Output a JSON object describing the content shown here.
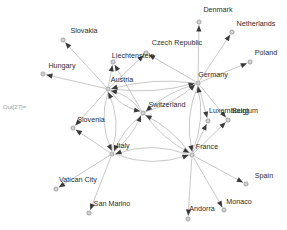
{
  "notebook": {
    "out_label": "Out[27]="
  },
  "graph": {
    "type": "directed-network",
    "title": "",
    "node_style": {
      "fill": "#d4d4d4",
      "stroke": "#8a8a8a",
      "radius": 2.1
    },
    "edge_style": {
      "stroke": "#9a9a9a",
      "width": 0.55,
      "arrow_fill": "#3a3a3a"
    },
    "nodes": [
      {
        "id": "Slovakia",
        "label": "Slovakia",
        "x": 63,
        "y": 40,
        "lx": 84,
        "ly": 33,
        "anchor": "middle"
      },
      {
        "id": "Hungary",
        "label": "Hungary",
        "x": 43,
        "y": 74,
        "lx": 62,
        "ly": 68,
        "anchor": "middle"
      },
      {
        "id": "Liechtenstein",
        "label": "Liechtenstein",
        "x": 113,
        "y": 62,
        "lx": 133,
        "ly": 58,
        "anchor": "middle"
      },
      {
        "id": "CzechRepublic",
        "label": "Czech Republic",
        "x": 146,
        "y": 53,
        "lx": 177,
        "ly": 45,
        "anchor": "middle"
      },
      {
        "id": "Denmark",
        "label": "Denmark",
        "x": 199,
        "y": 22,
        "lx": 218,
        "ly": 12,
        "anchor": "middle"
      },
      {
        "id": "Netherlands",
        "label": "Netherlands",
        "x": 232,
        "y": 32,
        "lx": 256,
        "ly": 26,
        "anchor": "middle"
      },
      {
        "id": "Poland",
        "label": "Poland",
        "x": 250,
        "y": 62,
        "lx": 266,
        "ly": 55,
        "anchor": "middle"
      },
      {
        "id": "Austria",
        "label": "Austria",
        "x": 108,
        "y": 89,
        "lx": 122,
        "ly": 82,
        "anchor": "middle"
      },
      {
        "id": "Germany",
        "label": "Germany",
        "x": 198,
        "y": 83,
        "lx": 213,
        "ly": 77,
        "anchor": "middle"
      },
      {
        "id": "Switzerland",
        "label": "Switzerland",
        "x": 143,
        "y": 113,
        "lx": 167,
        "ly": 107,
        "anchor": "middle"
      },
      {
        "id": "Luxembourg",
        "label": "Luxembourg",
        "x": 208,
        "y": 121,
        "lx": 229,
        "ly": 113,
        "anchor": "middle"
      },
      {
        "id": "Belgium",
        "label": "Belgium",
        "x": 228,
        "y": 120,
        "lx": 245,
        "ly": 113,
        "anchor": "middle"
      },
      {
        "id": "Slovenia",
        "label": "Slovenia",
        "x": 73,
        "y": 128,
        "lx": 91,
        "ly": 122,
        "anchor": "middle"
      },
      {
        "id": "Italy",
        "label": "Italy",
        "x": 112,
        "y": 154,
        "lx": 123,
        "ly": 148,
        "anchor": "middle"
      },
      {
        "id": "France",
        "label": "France",
        "x": 192,
        "y": 155,
        "lx": 207,
        "ly": 149,
        "anchor": "middle"
      },
      {
        "id": "VaticanCity",
        "label": "Vatican City",
        "x": 56,
        "y": 189,
        "lx": 78,
        "ly": 182,
        "anchor": "middle"
      },
      {
        "id": "SanMarino",
        "label": "San Marino",
        "x": 89,
        "y": 213,
        "lx": 112,
        "ly": 206,
        "anchor": "middle"
      },
      {
        "id": "Andorra",
        "label": "Andorra",
        "x": 188,
        "y": 219,
        "lx": 202,
        "ly": 211,
        "anchor": "middle"
      },
      {
        "id": "Monaco",
        "label": "Monaco",
        "x": 224,
        "y": 210,
        "lx": 239,
        "ly": 204,
        "anchor": "middle"
      },
      {
        "id": "Spain",
        "label": "Spain",
        "x": 246,
        "y": 184,
        "lx": 264,
        "ly": 178,
        "anchor": "middle"
      }
    ],
    "edges": [
      {
        "from": "Austria",
        "to": "Slovakia",
        "curve": 0
      },
      {
        "from": "Austria",
        "to": "Hungary",
        "curve": 0
      },
      {
        "from": "Austria",
        "to": "Liechtenstein",
        "curve": 0
      },
      {
        "from": "Austria",
        "to": "CzechRepublic",
        "curve": 0
      },
      {
        "from": "Austria",
        "to": "Slovenia",
        "curve": 0
      },
      {
        "from": "Austria",
        "to": "Switzerland",
        "curve": 8
      },
      {
        "from": "Switzerland",
        "to": "Austria",
        "curve": 8
      },
      {
        "from": "Austria",
        "to": "Germany",
        "curve": 9
      },
      {
        "from": "Germany",
        "to": "Austria",
        "curve": 9
      },
      {
        "from": "Austria",
        "to": "Italy",
        "curve": 12
      },
      {
        "from": "Italy",
        "to": "Austria",
        "curve": 12
      },
      {
        "from": "Germany",
        "to": "Denmark",
        "curve": 0
      },
      {
        "from": "Germany",
        "to": "Netherlands",
        "curve": 0
      },
      {
        "from": "Germany",
        "to": "Poland",
        "curve": 0
      },
      {
        "from": "Germany",
        "to": "CzechRepublic",
        "curve": 0
      },
      {
        "from": "Germany",
        "to": "Luxembourg",
        "curve": 0
      },
      {
        "from": "Germany",
        "to": "Belgium",
        "curve": 0
      },
      {
        "from": "Germany",
        "to": "Switzerland",
        "curve": 7
      },
      {
        "from": "Switzerland",
        "to": "Germany",
        "curve": 7
      },
      {
        "from": "Germany",
        "to": "France",
        "curve": 11
      },
      {
        "from": "France",
        "to": "Germany",
        "curve": 11
      },
      {
        "from": "Switzerland",
        "to": "Liechtenstein",
        "curve": 0
      },
      {
        "from": "Switzerland",
        "to": "Italy",
        "curve": 6
      },
      {
        "from": "Italy",
        "to": "Switzerland",
        "curve": 6
      },
      {
        "from": "Switzerland",
        "to": "France",
        "curve": 7
      },
      {
        "from": "France",
        "to": "Switzerland",
        "curve": 7
      },
      {
        "from": "Italy",
        "to": "Slovenia",
        "curve": 0
      },
      {
        "from": "Italy",
        "to": "VaticanCity",
        "curve": 0
      },
      {
        "from": "Italy",
        "to": "SanMarino",
        "curve": 0
      },
      {
        "from": "Italy",
        "to": "France",
        "curve": 14
      },
      {
        "from": "France",
        "to": "Italy",
        "curve": 14
      },
      {
        "from": "France",
        "to": "Luxembourg",
        "curve": 0
      },
      {
        "from": "France",
        "to": "Belgium",
        "curve": 0
      },
      {
        "from": "France",
        "to": "Spain",
        "curve": 0
      },
      {
        "from": "France",
        "to": "Andorra",
        "curve": 0
      },
      {
        "from": "France",
        "to": "Monaco",
        "curve": 0
      }
    ]
  }
}
